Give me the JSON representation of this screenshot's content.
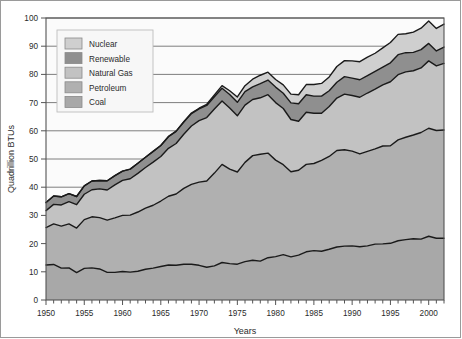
{
  "figure": {
    "background": "#ffffff",
    "plot_background": "#fbfbfb",
    "frame_color": "#555555"
  },
  "axes": {
    "y_title": "Quadrillion BTUs",
    "x_title": "Years",
    "y_ticks": [
      "0",
      "10",
      "20",
      "30",
      "40",
      "50",
      "60",
      "70",
      "80",
      "90",
      "100"
    ],
    "x_ticks": [
      "1950",
      "1955",
      "1960",
      "1965",
      "1970",
      "1975",
      "1980",
      "1985",
      "1990",
      "1995",
      "2000"
    ]
  },
  "legend": {
    "items": [
      {
        "label": "Nuclear",
        "color": "#cfcfcf"
      },
      {
        "label": "Renewable",
        "color": "#8f8f8f"
      },
      {
        "label": "Natural Gas",
        "color": "#c2c2c2"
      },
      {
        "label": "Petroleum",
        "color": "#b0b0b0"
      },
      {
        "label": "Coal",
        "color": "#a8a8a8"
      }
    ]
  },
  "chart_data": {
    "type": "area",
    "title": "",
    "subtitle": "",
    "xlabel": "Years",
    "ylabel": "Quadrillion BTUs",
    "xlim": [
      1950,
      2002
    ],
    "ylim": [
      0,
      100
    ],
    "grid": true,
    "stacked": true,
    "legend_position": "upper-left-inside",
    "x": [
      1950,
      1951,
      1952,
      1953,
      1954,
      1955,
      1956,
      1957,
      1958,
      1959,
      1960,
      1961,
      1962,
      1963,
      1964,
      1965,
      1966,
      1967,
      1968,
      1969,
      1970,
      1971,
      1972,
      1973,
      1974,
      1975,
      1976,
      1977,
      1978,
      1979,
      1980,
      1981,
      1982,
      1983,
      1984,
      1985,
      1986,
      1987,
      1988,
      1989,
      1990,
      1991,
      1992,
      1993,
      1994,
      1995,
      1996,
      1997,
      1998,
      1999,
      2000,
      2001,
      2002
    ],
    "series": [
      {
        "name": "Coal",
        "color": "#a8a8a8",
        "values": [
          12.4,
          12.6,
          11.3,
          11.4,
          9.7,
          11.2,
          11.4,
          11.0,
          9.8,
          9.8,
          10.1,
          9.9,
          10.2,
          10.9,
          11.3,
          11.9,
          12.4,
          12.3,
          12.7,
          12.7,
          12.3,
          11.6,
          12.1,
          13.3,
          12.9,
          12.7,
          13.6,
          14.1,
          13.8,
          15.0,
          15.4,
          16.1,
          15.3,
          15.9,
          17.1,
          17.5,
          17.3,
          18.0,
          18.8,
          19.1,
          19.2,
          18.9,
          19.2,
          19.8,
          19.9,
          20.1,
          21.0,
          21.4,
          21.7,
          21.6,
          22.6,
          21.9,
          21.9
        ]
      },
      {
        "name": "Petroleum",
        "color": "#b0b0b0",
        "values": [
          13.3,
          14.4,
          14.9,
          15.6,
          15.8,
          17.3,
          18.1,
          18.2,
          18.5,
          19.3,
          19.9,
          20.2,
          21.0,
          21.7,
          22.3,
          23.2,
          24.4,
          25.3,
          26.9,
          28.3,
          29.5,
          30.6,
          32.9,
          34.8,
          33.5,
          32.7,
          35.2,
          37.1,
          37.9,
          37.1,
          34.2,
          31.9,
          30.2,
          30.1,
          31.0,
          30.9,
          32.2,
          32.9,
          34.2,
          34.2,
          33.6,
          32.9,
          33.5,
          33.8,
          34.7,
          34.6,
          35.8,
          36.3,
          36.8,
          37.8,
          38.3,
          38.2,
          38.4
        ]
      },
      {
        "name": "Natural Gas",
        "color": "#c2c2c2",
        "values": [
          6.0,
          6.9,
          7.5,
          7.9,
          8.3,
          9.0,
          9.6,
          10.2,
          10.7,
          11.7,
          12.4,
          12.9,
          13.7,
          14.4,
          15.3,
          15.8,
          17.0,
          17.9,
          19.2,
          20.7,
          21.8,
          22.5,
          22.7,
          22.5,
          21.7,
          19.9,
          20.3,
          19.9,
          20.0,
          20.7,
          20.4,
          19.9,
          18.5,
          17.4,
          18.5,
          17.8,
          16.7,
          17.7,
          18.6,
          19.7,
          19.7,
          20.1,
          20.7,
          21.2,
          21.7,
          22.7,
          23.1,
          23.2,
          22.8,
          22.9,
          23.9,
          22.9,
          23.6
        ]
      },
      {
        "name": "Renewable",
        "color": "#8f8f8f",
        "values": [
          2.9,
          3.0,
          2.9,
          2.8,
          2.9,
          3.0,
          3.1,
          3.0,
          3.3,
          3.3,
          3.3,
          3.4,
          3.6,
          3.6,
          3.8,
          3.9,
          4.1,
          4.3,
          4.3,
          4.4,
          4.2,
          4.3,
          4.4,
          4.5,
          4.8,
          4.8,
          4.8,
          4.5,
          5.0,
          5.2,
          5.5,
          5.4,
          5.9,
          6.2,
          6.2,
          6.1,
          6.1,
          5.6,
          5.6,
          6.2,
          6.2,
          6.2,
          6.2,
          6.3,
          6.3,
          6.7,
          7.1,
          6.8,
          6.5,
          6.5,
          6.2,
          5.3,
          5.8
        ]
      },
      {
        "name": "Nuclear",
        "color": "#cfcfcf",
        "values": [
          0.0,
          0.0,
          0.0,
          0.0,
          0.0,
          0.0,
          0.0,
          0.0,
          0.0,
          0.0,
          0.0,
          0.0,
          0.0,
          0.0,
          0.0,
          0.0,
          0.1,
          0.1,
          0.1,
          0.2,
          0.2,
          0.4,
          0.6,
          0.9,
          1.3,
          1.9,
          2.1,
          2.7,
          3.0,
          2.8,
          2.7,
          3.0,
          3.1,
          3.2,
          3.6,
          4.1,
          4.5,
          4.9,
          5.6,
          5.7,
          6.1,
          6.4,
          6.5,
          6.4,
          6.8,
          7.2,
          7.2,
          6.7,
          7.2,
          7.6,
          7.9,
          8.0,
          8.1
        ]
      }
    ],
    "totals_note": "Stacked total peaks near 99 around 2000"
  }
}
